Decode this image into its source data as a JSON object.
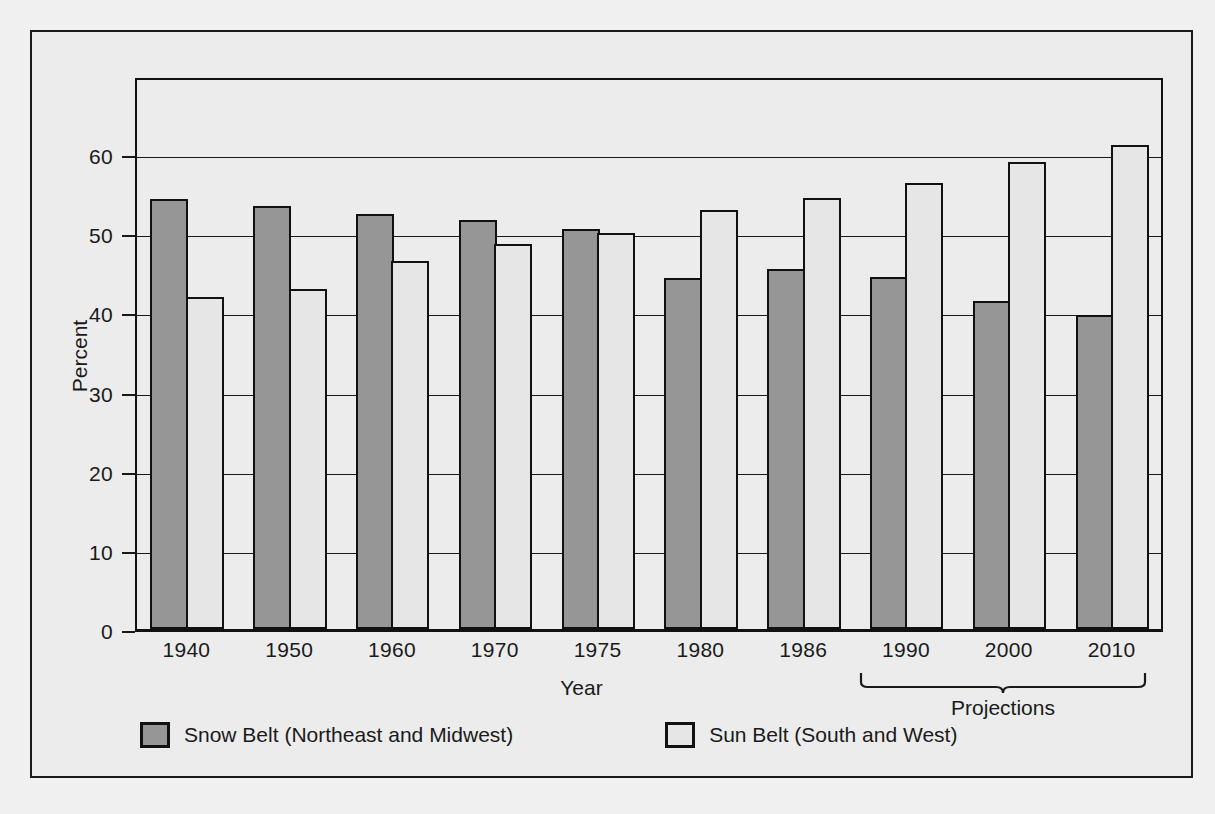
{
  "chart_data": {
    "type": "bar",
    "title": "",
    "xlabel": "Year",
    "ylabel": "Percent",
    "ylim": [
      0,
      70
    ],
    "yticks": [
      0,
      10,
      20,
      30,
      40,
      50,
      60
    ],
    "ytick_labels": [
      "0",
      "10",
      "20",
      "30",
      "40",
      "50",
      "60"
    ],
    "grid": true,
    "legend_position": "bottom-left",
    "categories": [
      "1940",
      "1950",
      "1960",
      "1970",
      "1975",
      "1980",
      "1986",
      "1990",
      "2000",
      "2010"
    ],
    "series": [
      {
        "name": "Snow Belt (Northeast and Midwest)",
        "color": "#969696",
        "values": [
          54.3,
          53.4,
          52.5,
          51.7,
          50.6,
          44.4,
          45.5,
          44.5,
          41.5,
          39.7
        ]
      },
      {
        "name": "Sun Belt (South and West)",
        "color": "#e6e6e6",
        "values": [
          42.0,
          42.9,
          46.5,
          48.7,
          50.1,
          52.9,
          54.4,
          56.4,
          59.0,
          61.1
        ]
      }
    ],
    "annotations": [
      {
        "name": "projections-bracket",
        "label": "Projections",
        "covers": [
          "1990",
          "2000",
          "2010"
        ]
      }
    ]
  },
  "axes": {
    "y_title": "Percent",
    "x_title": "Year",
    "y_ticks": [
      "60",
      "50",
      "40",
      "30",
      "20",
      "10",
      "0"
    ],
    "x_ticks": [
      "1940",
      "1950",
      "1960",
      "1970",
      "1975",
      "1980",
      "1986",
      "1990",
      "2000",
      "2010"
    ]
  },
  "annotations": {
    "projections_label": "Projections"
  },
  "legend": {
    "items": [
      {
        "label": "Snow Belt (Northeast and Midwest)",
        "color": "#969696"
      },
      {
        "label": "Sun Belt (South and West)",
        "color": "#e6e6e6"
      }
    ]
  }
}
